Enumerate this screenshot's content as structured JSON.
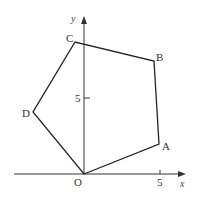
{
  "diagram": {
    "type": "coordinate-geometry",
    "axes": {
      "x_label": "x",
      "y_label": "y",
      "x_tick_label": "5",
      "y_tick_label": "5",
      "origin_label": "O"
    },
    "polygon": {
      "vertices": [
        {
          "label": "O",
          "x": 0,
          "y": 0
        },
        {
          "label": "A",
          "x": 5,
          "y": 2
        },
        {
          "label": "B",
          "x": 4.6,
          "y": 7.4
        },
        {
          "label": "C",
          "x": -0.6,
          "y": 8.7
        },
        {
          "label": "D",
          "x": -3.4,
          "y": 4.1
        }
      ]
    },
    "colors": {
      "line": "#222222",
      "text": "#333333",
      "background": "#ffffff"
    }
  }
}
